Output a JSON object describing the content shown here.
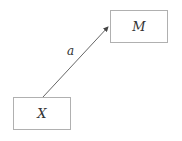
{
  "diagram": {
    "nodes": [
      {
        "id": "X",
        "label": "X"
      },
      {
        "id": "M",
        "label": "M"
      }
    ],
    "edges": [
      {
        "from": "X",
        "to": "M",
        "label": "a"
      }
    ]
  }
}
